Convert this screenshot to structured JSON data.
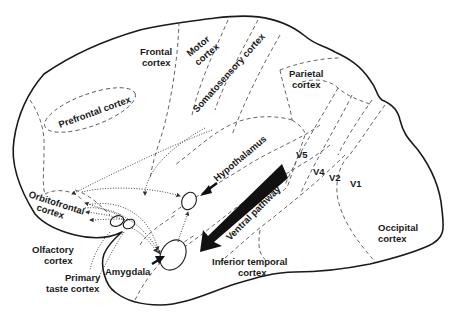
{
  "diagram": {
    "type": "brain-lateral-schematic",
    "labels": {
      "frontal": [
        "Frontal",
        "cortex"
      ],
      "motor": [
        "Motor",
        "cortex"
      ],
      "somatosensory": "Somatosensory cortex",
      "parietal": [
        "Parietal",
        "cortex"
      ],
      "prefrontal": "Prefrontal cortex",
      "hypothalamus": "Hypothalamus",
      "orbitofrontal": [
        "Orbitofrontal",
        "cortex"
      ],
      "olfactory": [
        "Olfactory",
        "cortex"
      ],
      "primary_taste": [
        "Primary",
        "taste cortex"
      ],
      "amygdala": "Amygdala",
      "ventral_pathway": "Ventral pathway",
      "inferior_temporal": [
        "Inferior temporal",
        "cortex"
      ],
      "occipital": [
        "Occipital",
        "cortex"
      ],
      "v5": "V5",
      "v4": "V4",
      "v2": "V2",
      "v1": "V1"
    },
    "colors": {
      "line": "#1a1a1a",
      "dashed": "#555555",
      "background": "#ffffff"
    }
  }
}
